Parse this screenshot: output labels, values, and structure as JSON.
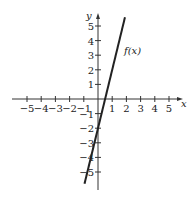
{
  "chart_data": {
    "type": "line",
    "title": "",
    "xlabel": "x",
    "ylabel": "y",
    "xlim": [
      -5.5,
      5.5
    ],
    "ylim": [
      -6,
      6
    ],
    "x_ticks": [
      -5,
      -4,
      -3,
      -2,
      -1,
      1,
      2,
      3,
      4,
      5
    ],
    "x_tick_labels": [
      "−5",
      "−4",
      "−3",
      "−2",
      "−1",
      "1",
      "2",
      "3",
      "4",
      "5"
    ],
    "y_ticks": [
      5,
      4,
      3,
      2,
      1,
      -1,
      -2,
      -3,
      -4,
      -5
    ],
    "y_tick_labels": [
      "5",
      "4",
      "3",
      "2",
      "1",
      "−1",
      "−2",
      "−3",
      "−4",
      "−5"
    ],
    "grid": false,
    "series": [
      {
        "name": "f(x)",
        "x": [
          -0.95,
          0,
          0.5,
          1.9
        ],
        "y": [
          -5.8,
          -2,
          0,
          5.6
        ]
      }
    ],
    "annotations": [
      {
        "text": "f(x)",
        "x": 2.0,
        "y": 3.2
      }
    ]
  },
  "labels": {
    "x_axis": "x",
    "y_axis": "y",
    "curve": "f(x)"
  }
}
